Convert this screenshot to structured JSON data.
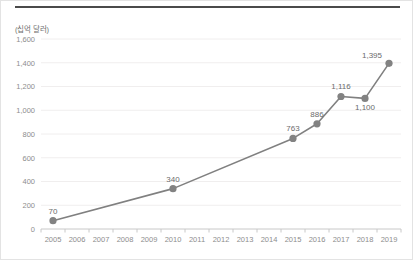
{
  "figure": {
    "unit_label": "(십억 달러)",
    "line_color": "#808080",
    "marker_color": "#828282",
    "grid_color": "#f0eeee",
    "axis_color": "#c8c8c8",
    "tick_text_color": "#8d8d8d",
    "label_text_color": "#6b6b6b",
    "rule_color": "#4a4a4a"
  },
  "chart_data": {
    "type": "line",
    "title": "",
    "xlabel": "",
    "ylabel": "(십억 달러)",
    "categories": [
      "2005",
      "2006",
      "2007",
      "2008",
      "2009",
      "2010",
      "2011",
      "2012",
      "2013",
      "2014",
      "2015",
      "2016",
      "2017",
      "2018",
      "2019"
    ],
    "yticks": [
      "0",
      "200",
      "400",
      "600",
      "800",
      "1,000",
      "1,200",
      "1,400",
      "1,600"
    ],
    "ytick_values": [
      0,
      200,
      400,
      600,
      800,
      1000,
      1200,
      1400,
      1600
    ],
    "ylim": [
      0,
      1600
    ],
    "grid": true,
    "legend": false,
    "series": [
      {
        "name": "",
        "points": [
          {
            "x": "2005",
            "y": 70,
            "label": "70",
            "label_pos": "above"
          },
          {
            "x": "2010",
            "y": 340,
            "label": "340",
            "label_pos": "above"
          },
          {
            "x": "2015",
            "y": 763,
            "label": "763",
            "label_pos": "above"
          },
          {
            "x": "2016",
            "y": 886,
            "label": "886",
            "label_pos": "above"
          },
          {
            "x": "2017",
            "y": 1116,
            "label": "1,116",
            "label_pos": "above"
          },
          {
            "x": "2018",
            "y": 1100,
            "label": "1,100",
            "label_pos": "below"
          },
          {
            "x": "2019",
            "y": 1395,
            "label": "1,395",
            "label_pos": "above-left"
          }
        ]
      }
    ]
  }
}
